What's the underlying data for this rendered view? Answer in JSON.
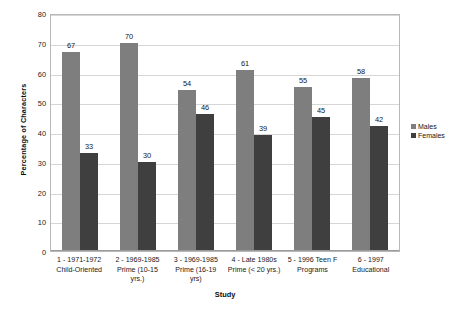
{
  "chart_data": {
    "type": "bar",
    "title": "",
    "xlabel": "Study",
    "ylabel": "Percentage of Characters",
    "ylim": [
      0,
      80
    ],
    "ytick_step": 10,
    "yticks": [
      0,
      10,
      20,
      30,
      40,
      50,
      60,
      70,
      80
    ],
    "grid": true,
    "legend_position": "right",
    "categories": [
      "1 - 1971-1972 Child-Oriented",
      "2 - 1969-1985 Prime (10-15 yrs.)",
      "3 - 1969-1985 Prime (16-19 yrs)",
      "4 - Late 1980s Prime (< 20 yrs.)",
      "5 - 1996 Teen F Programs",
      "6 - 1997 Educational"
    ],
    "category_lines": [
      [
        "1 - 1971-1972",
        "Child-Oriented"
      ],
      [
        "2 - 1969-1985",
        "Prime (10-15",
        "yrs.)"
      ],
      [
        "3 - 1969-1985",
        "Prime (16-19",
        "yrs)"
      ],
      [
        "4 - Late 1980s",
        "Prime (< 20 yrs.)"
      ],
      [
        "5 - 1996 Teen F",
        "Programs"
      ],
      [
        "6 - 1997",
        "Educational"
      ]
    ],
    "series": [
      {
        "name": "Males",
        "color": "#7e7e7e",
        "values": [
          67,
          70,
          54,
          61,
          55,
          58
        ]
      },
      {
        "name": "Females",
        "color": "#3f3f3f",
        "values": [
          33,
          30,
          46,
          39,
          45,
          42
        ]
      }
    ]
  },
  "legend": {
    "items": [
      {
        "label": "Males"
      },
      {
        "label": "Females"
      }
    ]
  }
}
